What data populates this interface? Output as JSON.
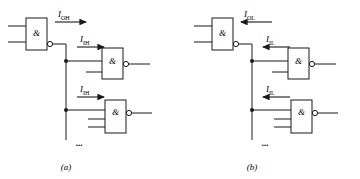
{
  "figure": {
    "stroke_color": "#1a1a1a",
    "background_color": "#ffffff"
  },
  "panels": [
    {
      "id": "a",
      "caption": "(a)",
      "state": "HIGH",
      "driver": {
        "symbol": "&",
        "symbol_name": "and-symbol",
        "input_count": 2,
        "inverting_output": true,
        "name": "driving-gate"
      },
      "output_current": {
        "label_base": "I",
        "label_sub": "OH",
        "full": "IOH",
        "arrow_direction": "right"
      },
      "loads": [
        {
          "index": 1,
          "symbol": "&",
          "input_count": 2,
          "inverting_output": true,
          "input_current": {
            "label_base": "I",
            "label_sub": "IH",
            "full": "IIH",
            "arrow_direction": "right"
          }
        },
        {
          "index": 2,
          "symbol": "&",
          "input_count": 3,
          "inverting_output": true,
          "input_current": {
            "label_base": "I",
            "label_sub": "IH",
            "full": "IIH",
            "arrow_direction": "right"
          }
        }
      ],
      "continuation": "..."
    },
    {
      "id": "b",
      "caption": "(b)",
      "state": "LOW",
      "driver": {
        "symbol": "&",
        "symbol_name": "and-symbol",
        "input_count": 2,
        "inverting_output": true,
        "name": "driving-gate"
      },
      "output_current": {
        "label_base": "I",
        "label_sub": "OL",
        "full": "IOL",
        "arrow_direction": "left"
      },
      "loads": [
        {
          "index": 1,
          "symbol": "&",
          "input_count": 2,
          "inverting_output": true,
          "input_current": {
            "label_base": "I",
            "label_sub": "IL",
            "full": "IIL",
            "arrow_direction": "left"
          }
        },
        {
          "index": 2,
          "symbol": "&",
          "input_count": 3,
          "inverting_output": true,
          "input_current": {
            "label_base": "I",
            "label_sub": "IL",
            "full": "IIL",
            "arrow_direction": "left"
          }
        }
      ],
      "continuation": "..."
    }
  ]
}
